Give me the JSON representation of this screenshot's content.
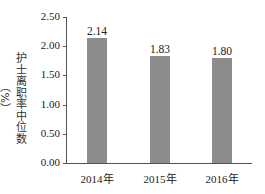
{
  "chart_data": {
    "type": "bar",
    "title": "",
    "xlabel": "",
    "ylabel": "护士离职率中位数（%）",
    "categories": [
      "2014年",
      "2015年",
      "2016年"
    ],
    "values": [
      2.14,
      1.83,
      1.8
    ],
    "value_labels": [
      "2.14",
      "1.83",
      "1.80"
    ],
    "ylim": [
      0,
      2.5
    ],
    "yticks": [
      "0.00",
      "0.50",
      "1.00",
      "1.50",
      "2.00",
      "2.50"
    ],
    "grid": false,
    "legend": null,
    "bar_color": "#8c8c8c"
  }
}
